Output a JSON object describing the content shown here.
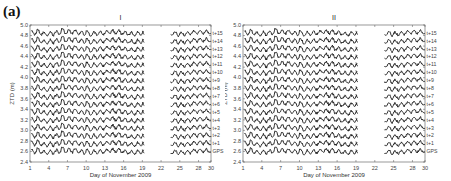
{
  "figure": {
    "label": "(a)"
  },
  "chart_data": [
    {
      "type": "line",
      "title": "I",
      "xlabel": "Day of November 2009",
      "ylabel": "ZTD (m)",
      "xlim": [
        1,
        30
      ],
      "ylim": [
        2.4,
        5.0
      ],
      "xticks": [
        1,
        4,
        7,
        10,
        13,
        16,
        19,
        22,
        25,
        28,
        30
      ],
      "yticks": [
        2.4,
        2.6,
        2.8,
        3.0,
        3.2,
        3.4,
        3.6,
        3.8,
        4.0,
        4.2,
        4.4,
        4.6,
        4.8,
        5.0
      ],
      "grid": false,
      "data_gap": [
        19.2,
        23.5
      ],
      "series": [
        {
          "name": "GPS",
          "offset": 2.6
        },
        {
          "name": "t+1",
          "offset": 2.75
        },
        {
          "name": "t+2",
          "offset": 2.9
        },
        {
          "name": "t+3",
          "offset": 3.05
        },
        {
          "name": "t+4",
          "offset": 3.2
        },
        {
          "name": "t+5",
          "offset": 3.35
        },
        {
          "name": "t+6",
          "offset": 3.5
        },
        {
          "name": "t+7",
          "offset": 3.65
        },
        {
          "name": "t+8",
          "offset": 3.8
        },
        {
          "name": "t+9",
          "offset": 3.95
        },
        {
          "name": "t+10",
          "offset": 4.1
        },
        {
          "name": "t+11",
          "offset": 4.25
        },
        {
          "name": "t+12",
          "offset": 4.4
        },
        {
          "name": "t+13",
          "offset": 4.55
        },
        {
          "name": "t+14",
          "offset": 4.7
        },
        {
          "name": "t+15",
          "offset": 4.85
        }
      ],
      "note": "Each series is ZTD time series (~±0.05 m variation) stacked with vertical offset; label at right edge"
    },
    {
      "type": "line",
      "title": "II",
      "xlabel": "Day of November 2009",
      "ylabel": "ZTD (m)",
      "xlim": [
        1,
        30
      ],
      "ylim": [
        2.4,
        5.0
      ],
      "xticks": [
        1,
        4,
        7,
        10,
        13,
        16,
        19,
        22,
        25,
        28,
        30
      ],
      "yticks": [
        2.4,
        2.6,
        2.8,
        3.0,
        3.2,
        3.4,
        3.6,
        3.8,
        4.0,
        4.2,
        4.4,
        4.6,
        4.8,
        5.0
      ],
      "grid": false,
      "data_gap": [
        19.2,
        23.5
      ],
      "series": [
        {
          "name": "GPS",
          "offset": 2.6
        },
        {
          "name": "t+1",
          "offset": 2.75
        },
        {
          "name": "t+2",
          "offset": 2.9
        },
        {
          "name": "t+3",
          "offset": 3.05
        },
        {
          "name": "t+4",
          "offset": 3.2
        },
        {
          "name": "t+5",
          "offset": 3.35
        },
        {
          "name": "t+6",
          "offset": 3.5
        },
        {
          "name": "t+7",
          "offset": 3.65
        },
        {
          "name": "t+8",
          "offset": 3.8
        },
        {
          "name": "t+9",
          "offset": 3.95
        },
        {
          "name": "t+10",
          "offset": 4.1
        },
        {
          "name": "t+11",
          "offset": 4.25
        },
        {
          "name": "t+12",
          "offset": 4.4
        },
        {
          "name": "t+13",
          "offset": 4.55
        },
        {
          "name": "t+14",
          "offset": 4.7
        },
        {
          "name": "t+15",
          "offset": 4.85
        }
      ],
      "note": "Each series is ZTD time series (~±0.05 m variation) stacked with vertical offset; label at right edge"
    }
  ],
  "layout": {
    "panels": [
      {
        "left": 30,
        "right": 211,
        "top": 25,
        "bottom": 162,
        "svg_x": 0
      },
      {
        "left": 18,
        "right": 200,
        "top": 25,
        "bottom": 162,
        "svg_x": 225
      }
    ],
    "line_color": "#1a1a1a",
    "axis_color": "#555555"
  }
}
